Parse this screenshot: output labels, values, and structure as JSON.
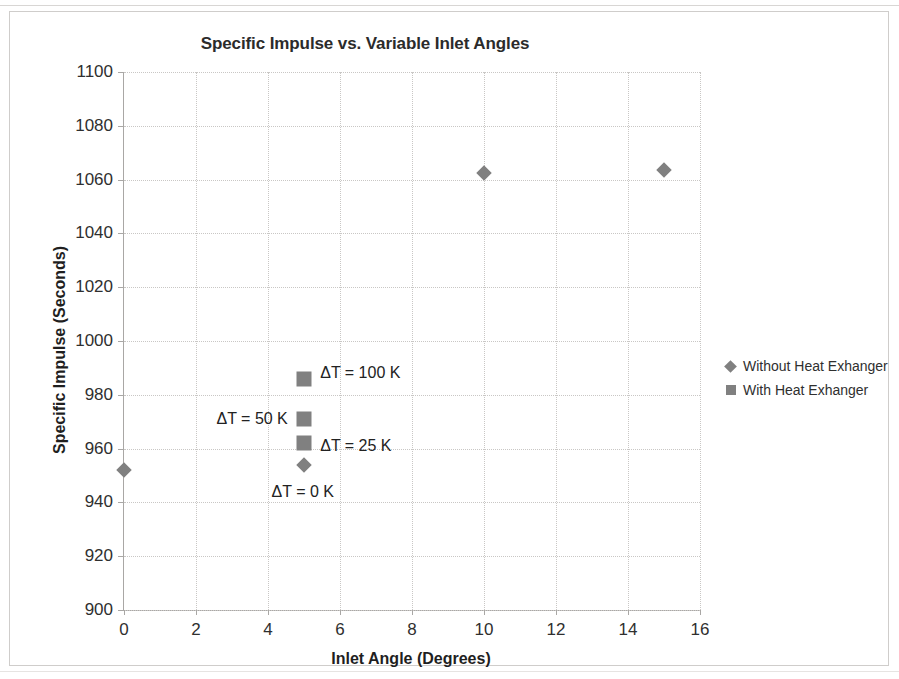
{
  "chart_data": {
    "type": "scatter",
    "title": "Specific Impulse vs. Variable Inlet Angles",
    "xlabel": "Inlet Angle (Degrees)",
    "ylabel": "Specific Impulse (Seconds)",
    "xlim": [
      0,
      16
    ],
    "ylim": [
      900,
      1100
    ],
    "xticks": [
      0,
      2,
      4,
      6,
      8,
      10,
      12,
      14,
      16
    ],
    "yticks": [
      900,
      920,
      940,
      960,
      980,
      1000,
      1020,
      1040,
      1060,
      1080,
      1100
    ],
    "grid": true,
    "legend_position": "right",
    "marker_color": "#808080",
    "series": [
      {
        "name": "Without Heat Exhanger",
        "marker": "diamond",
        "color": "#808080",
        "points": [
          {
            "x": 0,
            "y": 952
          },
          {
            "x": 5,
            "y": 954
          },
          {
            "x": 10,
            "y": 1062.5
          },
          {
            "x": 15,
            "y": 1063.5
          }
        ]
      },
      {
        "name": "With Heat Exhanger",
        "marker": "square",
        "color": "#808080",
        "points": [
          {
            "x": 5,
            "y": 986
          },
          {
            "x": 5,
            "y": 971
          },
          {
            "x": 5,
            "y": 962
          }
        ]
      }
    ],
    "annotations": [
      {
        "text": "ΔT = 100 K",
        "x": 5.45,
        "y": 988,
        "align": "left"
      },
      {
        "text": "ΔT = 50 K",
        "x": 4.55,
        "y": 971,
        "align": "right"
      },
      {
        "text": "ΔT = 25 K",
        "x": 5.45,
        "y": 961,
        "align": "left"
      },
      {
        "text": "ΔT = 0 K",
        "x": 4.1,
        "y": 944,
        "align": "left"
      }
    ]
  },
  "axis": {
    "y_tick_labels": [
      "1100",
      "1080",
      "1060",
      "1040",
      "1020",
      "1000",
      "980",
      "960",
      "940",
      "920",
      "900"
    ],
    "x_tick_labels": [
      "0",
      "2",
      "4",
      "6",
      "8",
      "10",
      "12",
      "14",
      "16"
    ]
  },
  "legend": {
    "items": [
      {
        "label": "Without Heat Exhanger",
        "marker": "diamond"
      },
      {
        "label": "With Heat Exhanger",
        "marker": "square"
      }
    ]
  }
}
